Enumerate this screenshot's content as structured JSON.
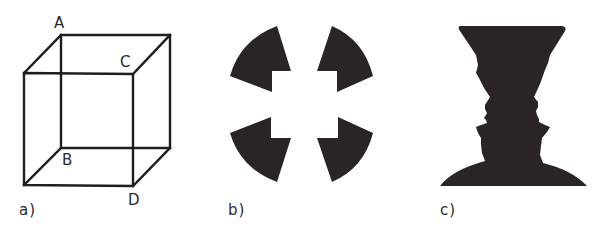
{
  "figure": {
    "panels": [
      {
        "id": "a",
        "label": "a)",
        "title": "Necker cube",
        "vertex_labels": {
          "A": "A",
          "B": "B",
          "C": "C",
          "D": "D"
        }
      },
      {
        "id": "b",
        "label": "b)",
        "title": "Illusory square (Kanizsa-type figure)"
      },
      {
        "id": "c",
        "label": "c)",
        "title": "Rubin vase / faces"
      }
    ],
    "colors": {
      "background": "#ffffff",
      "ink": "#2a2426",
      "line": "#1e1e1e",
      "text": "#2a2a2a"
    }
  }
}
